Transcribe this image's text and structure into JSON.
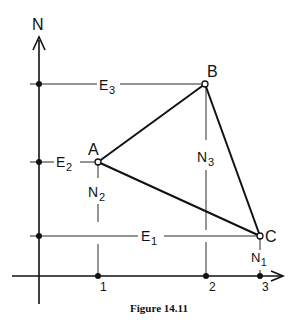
{
  "figure": {
    "caption": "Figure 14.11",
    "axes": {
      "vertical_label": "N",
      "horizontal_ticks": [
        "1",
        "2",
        "3"
      ]
    },
    "points": {
      "A": "A",
      "B": "B",
      "C": "C"
    },
    "easting_labels": {
      "E1": "E",
      "E1_sub": "1",
      "E2": "E",
      "E2_sub": "2",
      "E3": "E",
      "E3_sub": "3"
    },
    "northing_labels": {
      "N1": "N",
      "N1_sub": "1",
      "N2": "N",
      "N2_sub": "2",
      "N3": "N",
      "N3_sub": "3"
    },
    "colors": {
      "ink": "#111111",
      "background": "#ffffff"
    }
  }
}
